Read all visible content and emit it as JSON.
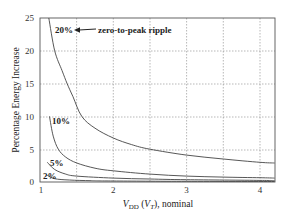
{
  "chart_data": {
    "type": "line",
    "title": "",
    "xlabel": "V_DD (V_T), nominal",
    "ylabel": "Percentage Energy Increase",
    "xlim": [
      1,
      4.2
    ],
    "ylim": [
      0,
      25
    ],
    "x_ticks": [
      1,
      2,
      3,
      4
    ],
    "y_ticks": [
      0,
      5,
      10,
      15,
      20,
      25
    ],
    "grid": true,
    "legend_position": "none (inline labels)",
    "annotations": [
      {
        "text": "zero-to-peak ripple",
        "points_to": "20%"
      }
    ],
    "series": [
      {
        "name": "20%",
        "x": [
          1.12,
          1.2,
          1.3,
          1.37,
          1.45,
          1.57,
          1.75,
          2.0,
          2.25,
          2.5,
          3.0,
          3.5,
          4.0,
          4.2
        ],
        "y": [
          25,
          20,
          17,
          15,
          13,
          10,
          8.2,
          6.7,
          5.7,
          5.0,
          4.1,
          3.5,
          3.0,
          2.9
        ]
      },
      {
        "name": "10%",
        "x": [
          1.13,
          1.18,
          1.25,
          1.35,
          1.5,
          1.75,
          2.0,
          2.5,
          3.0,
          3.5,
          4.0,
          4.2
        ],
        "y": [
          10,
          7,
          5,
          3.8,
          2.9,
          2.1,
          1.7,
          1.2,
          0.9,
          0.75,
          0.65,
          0.6
        ]
      },
      {
        "name": "5%",
        "x": [
          1.1,
          1.2,
          1.35,
          1.5,
          2.0,
          2.5,
          3.0,
          4.0,
          4.2
        ],
        "y": [
          3.0,
          1.9,
          1.2,
          0.9,
          0.6,
          0.45,
          0.35,
          0.25,
          0.22
        ]
      },
      {
        "name": "2%",
        "x": [
          1.1,
          1.2,
          1.4,
          1.7,
          2.0,
          3.0,
          4.2
        ],
        "y": [
          1.0,
          0.5,
          0.3,
          0.2,
          0.15,
          0.1,
          0.08
        ]
      }
    ]
  },
  "labels": {
    "ylabel": "Percentage Energy Increase",
    "xlabel_main": "V",
    "xlabel_sub": "DD",
    "xlabel_paren_open": " (",
    "xlabel_vt": "V",
    "xlabel_vt_sub": "T",
    "xlabel_rest": "), nominal",
    "annotation": "zero-to-peak ripple",
    "s20": "20%",
    "s10": "10%",
    "s5": "5%",
    "s2": "2%",
    "xt1": "1",
    "xt2": "2",
    "xt3": "3",
    "xt4": "4",
    "yt0": "0",
    "yt5": "5",
    "yt10": "10",
    "yt15": "15",
    "yt20": "20",
    "yt25": "25"
  }
}
